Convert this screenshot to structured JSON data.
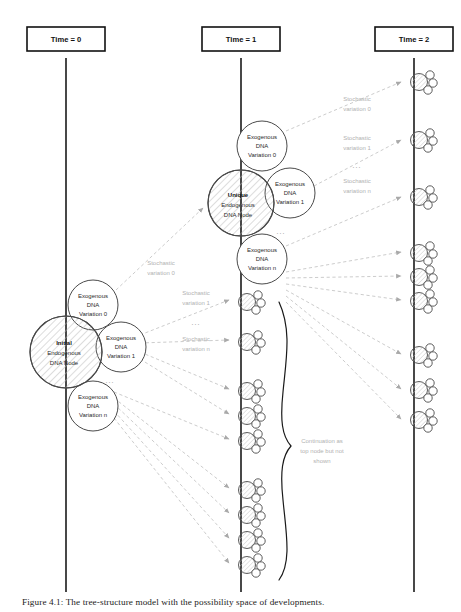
{
  "figure": {
    "caption": "Figure 4.1: The tree-structure model with the possibility space of developments.",
    "colors": {
      "axis": "#1a1a1a",
      "node_stroke": "#4a4a4a",
      "hatch": "#9a9a9a",
      "dashed_arrow": "#bdbdbd",
      "muted_text": "#b2b2b2",
      "brace": "#1a1a1a"
    }
  },
  "timeline": {
    "columns": [
      {
        "id": "t0",
        "label": "Time = 0",
        "x": 66
      },
      {
        "id": "t1",
        "label": "Time = 1",
        "x": 241
      },
      {
        "id": "t2",
        "label": "Time = 2",
        "x": 414
      }
    ]
  },
  "endogenous_nodes": [
    {
      "id": "initial-node",
      "column": "t0",
      "title": "Initial",
      "line1": "Endogenous",
      "line2": "DNA Node",
      "cx": 66,
      "cy": 352,
      "r": 36
    },
    {
      "id": "unique-node",
      "column": "t1",
      "title": "Unique",
      "line1": "Endogenous",
      "line2": "DNA Node",
      "cx": 241,
      "cy": 203,
      "r": 33
    }
  ],
  "exogenous_nodes": [
    {
      "id": "t0-exo-0",
      "parent": "initial-node",
      "line1": "Exogenous",
      "line2": "DNA",
      "line3": "Variation 0",
      "cx": 93,
      "cy": 305,
      "r": 25
    },
    {
      "id": "t0-exo-1",
      "parent": "initial-node",
      "line1": "Exogenous",
      "line2": "DNA",
      "line3": "Variation 1",
      "cx": 121,
      "cy": 347,
      "r": 25
    },
    {
      "id": "t0-exo-n",
      "parent": "initial-node",
      "line1": "Exogenous",
      "line2": "DNA",
      "line3": "Variation n",
      "cx": 93,
      "cy": 406,
      "r": 25
    },
    {
      "id": "t1-exo-0",
      "parent": "unique-node",
      "line1": "Exogenous",
      "line2": "DNA",
      "line3": "Variation 0",
      "cx": 262,
      "cy": 146,
      "r": 25
    },
    {
      "id": "t1-exo-1",
      "parent": "unique-node",
      "line1": "Exogenous",
      "line2": "DNA",
      "line3": "Variation 1",
      "cx": 290,
      "cy": 193,
      "r": 25
    },
    {
      "id": "t1-exo-n",
      "parent": "unique-node",
      "line1": "Exogenous",
      "line2": "DNA",
      "line3": "Variation n",
      "cx": 262,
      "cy": 259,
      "r": 25
    }
  ],
  "ellipses": [
    {
      "id": "ellipsis-t0-cluster",
      "text": "...",
      "x": 110,
      "y": 381
    },
    {
      "id": "ellipsis-t1-cluster",
      "text": "...",
      "x": 281,
      "y": 232
    },
    {
      "id": "ellipsis-stochastic-t0",
      "text": "...",
      "x": 196,
      "y": 327
    },
    {
      "id": "ellipsis-stochastic-t1",
      "text": "...",
      "x": 357,
      "y": 170
    }
  ],
  "stochastic_labels": [
    {
      "id": "stoch-t0-0",
      "line1": "Stochastic",
      "line2": "variation 0",
      "x": 161,
      "y": 268
    },
    {
      "id": "stoch-t0-1",
      "line1": "Stochastic",
      "line2": "variation 1",
      "x": 196,
      "y": 298
    },
    {
      "id": "stoch-t0-n",
      "line1": "Stochastic",
      "line2": "variation n",
      "x": 196,
      "y": 341
    },
    {
      "id": "stoch-t1-0",
      "line1": "Stochastic",
      "line2": "variation 0",
      "x": 357,
      "y": 104
    },
    {
      "id": "stoch-t1-1",
      "line1": "Stochastic",
      "line2": "variation 1",
      "x": 357,
      "y": 143
    },
    {
      "id": "stoch-t1-n",
      "line1": "Stochastic",
      "line2": "variation n",
      "x": 357,
      "y": 186
    }
  ],
  "brace_note": {
    "id": "continuation-note",
    "line1": "Continuation as",
    "line2": "top node but not",
    "line3": "shown",
    "x": 322,
    "y": 446
  },
  "clusters": {
    "t1_column_y": [
      302,
      342,
      391,
      416,
      441,
      490,
      515,
      540,
      565
    ],
    "t2_column_y": [
      82,
      140,
      197,
      253,
      277,
      301,
      355,
      390,
      420
    ]
  },
  "dashed_arrows": {
    "t0_to_t1_count": 9,
    "t1_to_t2_count": 9
  }
}
